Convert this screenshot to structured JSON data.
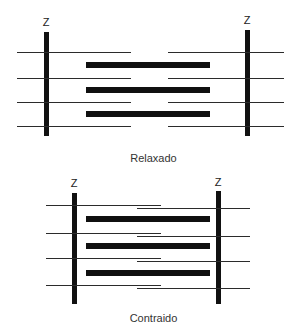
{
  "figure": {
    "title_visible": false,
    "colors": {
      "background": "#ffffff",
      "z_line": "#111111",
      "thick_filament": "#101010",
      "thin_filament": "#2b2b2b",
      "text": "#333333"
    }
  },
  "panels": [
    {
      "id": "relaxed",
      "caption": "Relaxado",
      "z_label_left": "Z",
      "z_label_right": "Z",
      "z_lines": [
        {
          "x": 44,
          "y": 32,
          "height": 104
        },
        {
          "x": 245,
          "y": 30,
          "height": 106
        }
      ],
      "thin_filaments": [
        {
          "row": 1,
          "side": "left",
          "x1": 17,
          "x2": 131,
          "y": 52
        },
        {
          "row": 1,
          "side": "right",
          "x1": 168,
          "x2": 284,
          "y": 52
        },
        {
          "row": 2,
          "side": "left",
          "x1": 17,
          "x2": 131,
          "y": 78
        },
        {
          "row": 2,
          "side": "right",
          "x1": 168,
          "x2": 284,
          "y": 78
        },
        {
          "row": 3,
          "side": "left",
          "x1": 17,
          "x2": 131,
          "y": 102
        },
        {
          "row": 3,
          "side": "right",
          "x1": 168,
          "x2": 284,
          "y": 102
        },
        {
          "row": 4,
          "side": "left",
          "x1": 17,
          "x2": 131,
          "y": 126
        },
        {
          "row": 4,
          "side": "right",
          "x1": 168,
          "x2": 284,
          "y": 126
        }
      ],
      "thick_filaments": [
        {
          "x1": 86,
          "x2": 210,
          "y": 63
        },
        {
          "x1": 86,
          "x2": 210,
          "y": 88
        },
        {
          "x1": 86,
          "x2": 210,
          "y": 112
        }
      ]
    },
    {
      "id": "contracted",
      "caption": "Contraido",
      "z_label_left": "Z",
      "z_label_right": "Z",
      "z_lines": [
        {
          "x": 72,
          "y": 193,
          "height": 111
        },
        {
          "x": 216,
          "y": 191,
          "height": 113
        }
      ],
      "thin_filaments": [
        {
          "row": 1,
          "side": "left",
          "x1": 46,
          "x2": 161,
          "y": 205
        },
        {
          "row": 1,
          "side": "right",
          "x1": 137,
          "x2": 250,
          "y": 208
        },
        {
          "row": 2,
          "side": "left",
          "x1": 46,
          "x2": 161,
          "y": 233
        },
        {
          "row": 2,
          "side": "right",
          "x1": 137,
          "x2": 250,
          "y": 236
        },
        {
          "row": 3,
          "side": "left",
          "x1": 46,
          "x2": 161,
          "y": 258
        },
        {
          "row": 3,
          "side": "right",
          "x1": 137,
          "x2": 250,
          "y": 261
        },
        {
          "row": 4,
          "side": "left",
          "x1": 46,
          "x2": 161,
          "y": 285
        },
        {
          "row": 4,
          "side": "right",
          "x1": 137,
          "x2": 250,
          "y": 288
        }
      ],
      "thick_filaments": [
        {
          "x1": 86,
          "x2": 210,
          "y": 219
        },
        {
          "x1": 86,
          "x2": 210,
          "y": 245
        },
        {
          "x1": 86,
          "x2": 210,
          "y": 272
        }
      ]
    }
  ],
  "captions": {
    "relaxed": "Relaxado",
    "contracted": "Contraido"
  }
}
